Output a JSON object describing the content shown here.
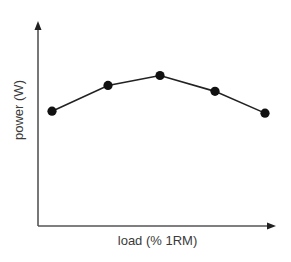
{
  "chart_data": {
    "type": "line",
    "title": "",
    "xlabel": "load (% 1RM)",
    "ylabel": "power (W)",
    "x": [
      1,
      2,
      3,
      4,
      5
    ],
    "series": [
      {
        "name": "power",
        "values": [
          0.58,
          0.71,
          0.76,
          0.68,
          0.57
        ],
        "marker": "circle",
        "color": "#111111"
      }
    ],
    "axis_ticks": false,
    "grid": false,
    "legend": "none",
    "ylim": [
      0,
      1
    ]
  },
  "colors": {
    "axis": "#555555",
    "line": "#222222",
    "marker": "#111111",
    "text": "#3a3a3a"
  },
  "labels": {
    "x_axis": "load (% 1RM)",
    "y_axis": "power (W)"
  }
}
